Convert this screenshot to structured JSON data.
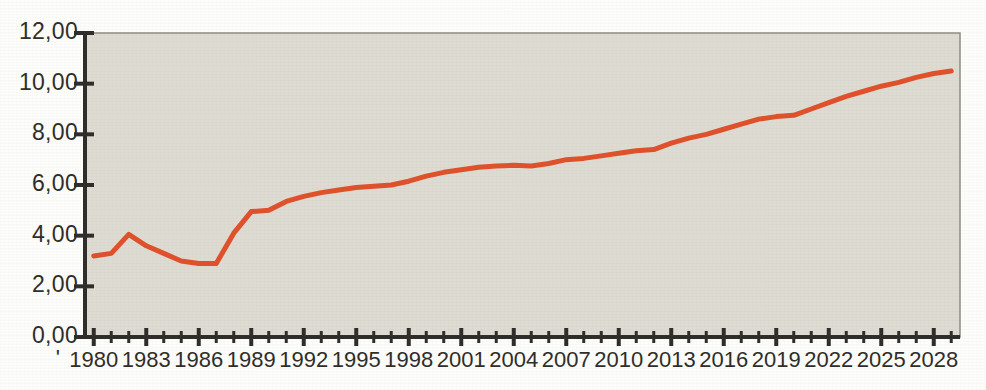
{
  "chart_data": {
    "type": "line",
    "title": "",
    "subtitle": "",
    "xlabel": "",
    "ylabel": "",
    "xlim": [
      1979.5,
      2029.5
    ],
    "ylim": [
      0,
      12
    ],
    "grid": false,
    "legend": null,
    "decimal_separator": ",",
    "y_tick_labels": [
      "0,00",
      "2,00",
      "4,00",
      "6,00",
      "8,00",
      "10,00",
      "12,00"
    ],
    "y_tick_values": [
      0,
      2,
      4,
      6,
      8,
      10,
      12
    ],
    "x_tick_labels": [
      "1980",
      "1983",
      "1986",
      "1989",
      "1992",
      "1995",
      "1998",
      "2001",
      "2004",
      "2007",
      "2010",
      "2013",
      "2016",
      "2019",
      "2022",
      "2025",
      "2028"
    ],
    "x_tick_values": [
      1980,
      1983,
      1986,
      1989,
      1992,
      1995,
      1998,
      2001,
      2004,
      2007,
      2010,
      2013,
      2016,
      2019,
      2022,
      2025,
      2028
    ],
    "x_minor_tick_interval": 1,
    "leading_mark": "'",
    "series": [
      {
        "name": "series-1",
        "color": "#e0502a",
        "x": [
          1980,
          1981,
          1982,
          1983,
          1984,
          1985,
          1986,
          1987,
          1988,
          1989,
          1990,
          1991,
          1992,
          1993,
          1994,
          1995,
          1996,
          1997,
          1998,
          1999,
          2000,
          2001,
          2002,
          2003,
          2004,
          2005,
          2006,
          2007,
          2008,
          2009,
          2010,
          2011,
          2012,
          2013,
          2014,
          2015,
          2016,
          2017,
          2018,
          2019,
          2020,
          2021,
          2022,
          2023,
          2024,
          2025,
          2026,
          2027,
          2028,
          2029
        ],
        "values": [
          3.2,
          3.3,
          4.05,
          3.6,
          3.3,
          3.0,
          2.9,
          2.9,
          4.1,
          4.95,
          5.0,
          5.35,
          5.55,
          5.7,
          5.8,
          5.9,
          5.95,
          6.0,
          6.15,
          6.35,
          6.5,
          6.6,
          6.7,
          6.75,
          6.78,
          6.75,
          6.85,
          7.0,
          7.05,
          7.15,
          7.25,
          7.35,
          7.4,
          7.65,
          7.85,
          8.0,
          8.2,
          8.4,
          8.6,
          8.7,
          8.75,
          9.0,
          9.25,
          9.5,
          9.7,
          9.9,
          10.05,
          10.25,
          10.4,
          10.5
        ]
      }
    ],
    "colors": {
      "line": "#e0502a",
      "plot_background": "#dedcd2",
      "axis": "#2e2c28",
      "page_background": "#fdfdfb",
      "tick_label": "#2e2c28"
    }
  }
}
